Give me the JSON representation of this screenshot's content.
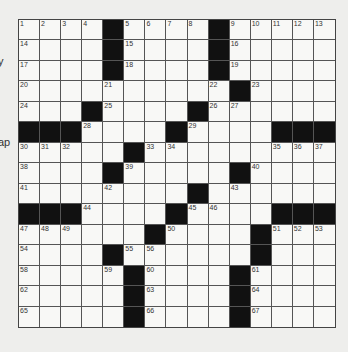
{
  "edge_text": [
    "y",
    "ap"
  ],
  "puzzle": {
    "rows": 15,
    "cols": 15,
    "layout": [
      "....#....#.....",
      "....#....#.....",
      "....#....#.....",
      "..........#....",
      "...#....#......",
      "###....#....###",
      ".....#.........",
      "....#.....#....",
      "........#......",
      "###....#....###",
      "......#....#...",
      "....#......#...",
      ".....#....#....",
      ".....#....#....",
      ".....#....#...."
    ],
    "numbers": [
      [
        0,
        0,
        1
      ],
      [
        0,
        1,
        2
      ],
      [
        0,
        2,
        3
      ],
      [
        0,
        3,
        4
      ],
      [
        0,
        5,
        5
      ],
      [
        0,
        6,
        6
      ],
      [
        0,
        7,
        7
      ],
      [
        0,
        8,
        8
      ],
      [
        0,
        10,
        9
      ],
      [
        0,
        11,
        10
      ],
      [
        0,
        12,
        11
      ],
      [
        0,
        13,
        12
      ],
      [
        0,
        14,
        13
      ],
      [
        1,
        0,
        14
      ],
      [
        1,
        5,
        15
      ],
      [
        1,
        10,
        16
      ],
      [
        2,
        0,
        17
      ],
      [
        2,
        5,
        18
      ],
      [
        2,
        10,
        19
      ],
      [
        3,
        0,
        20
      ],
      [
        3,
        4,
        21
      ],
      [
        3,
        9,
        22
      ],
      [
        3,
        11,
        23
      ],
      [
        4,
        0,
        24
      ],
      [
        4,
        4,
        25
      ],
      [
        4,
        9,
        26
      ],
      [
        4,
        10,
        27
      ],
      [
        5,
        3,
        28
      ],
      [
        5,
        8,
        29
      ],
      [
        6,
        0,
        30
      ],
      [
        6,
        1,
        31
      ],
      [
        6,
        2,
        32
      ],
      [
        6,
        6,
        33
      ],
      [
        6,
        7,
        34
      ],
      [
        6,
        12,
        35
      ],
      [
        6,
        13,
        36
      ],
      [
        6,
        14,
        37
      ],
      [
        7,
        0,
        38
      ],
      [
        7,
        5,
        39
      ],
      [
        7,
        11,
        40
      ],
      [
        8,
        0,
        41
      ],
      [
        8,
        4,
        42
      ],
      [
        8,
        10,
        43
      ],
      [
        9,
        3,
        44
      ],
      [
        9,
        8,
        45
      ],
      [
        9,
        9,
        46
      ],
      [
        10,
        0,
        47
      ],
      [
        10,
        1,
        48
      ],
      [
        10,
        2,
        49
      ],
      [
        10,
        7,
        50
      ],
      [
        10,
        12,
        51
      ],
      [
        10,
        13,
        52
      ],
      [
        10,
        14,
        53
      ],
      [
        11,
        0,
        54
      ],
      [
        11,
        5,
        55
      ],
      [
        11,
        6,
        56
      ],
      [
        11,
        11,
        57
      ],
      [
        12,
        0,
        58
      ],
      [
        12,
        4,
        59
      ],
      [
        12,
        6,
        60
      ],
      [
        12,
        11,
        61
      ],
      [
        13,
        0,
        62
      ],
      [
        13,
        6,
        63
      ],
      [
        13,
        11,
        64
      ],
      [
        14,
        0,
        65
      ],
      [
        14,
        6,
        66
      ],
      [
        14,
        11,
        67
      ]
    ],
    "colors": {
      "block": "#111111",
      "cell": "#f8f8f6",
      "line": "#555555"
    }
  }
}
